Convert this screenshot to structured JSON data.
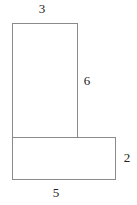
{
  "diagram": {
    "shapes": [
      {
        "name": "tall-rectangle",
        "x": 12,
        "y": 23,
        "width": 65,
        "height": 115
      },
      {
        "name": "base-rectangle",
        "x": 12,
        "y": 137,
        "width": 103,
        "height": 42
      }
    ],
    "labels": {
      "top_width": "3",
      "tall_height": "6",
      "base_height": "2",
      "base_width": "5"
    },
    "colors": {
      "stroke": "#8a8a8a",
      "text": "#222222",
      "background": "#ffffff"
    }
  }
}
